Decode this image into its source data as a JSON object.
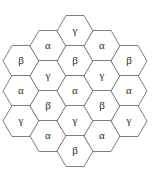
{
  "figure": {
    "name": "hexagonal-tiling-diagram",
    "type": "hexagon-grid",
    "width": 164,
    "height": 181,
    "background_color": "#ffffff",
    "stroke_color": "#5d5d5d",
    "label_color": "#2b2b2b",
    "hex_count": 19,
    "orientation": "flat-top",
    "hex_radius": 18,
    "hex_width": 36,
    "hex_height": 31,
    "columns": [
      {
        "cx": 21,
        "labels": [
          "β",
          "α",
          "γ"
        ],
        "cys": [
          61,
          91,
          121
        ]
      },
      {
        "cx": 48,
        "labels": [
          "α",
          "γ",
          "β",
          "α"
        ],
        "cys": [
          46,
          76,
          106,
          136
        ]
      },
      {
        "cx": 75,
        "labels": [
          "γ",
          "β",
          "α",
          "γ",
          "β"
        ],
        "cys": [
          31,
          61,
          91,
          121,
          151
        ]
      },
      {
        "cx": 102,
        "labels": [
          "α",
          "γ",
          "β",
          "α"
        ],
        "cys": [
          46,
          76,
          106,
          136
        ]
      },
      {
        "cx": 129,
        "labels": [
          "β",
          "α",
          "γ"
        ],
        "cys": [
          61,
          91,
          121
        ]
      }
    ],
    "cells": [
      {
        "id": "c0-r0",
        "label": "β",
        "cx": 21,
        "cy": 61
      },
      {
        "id": "c0-r1",
        "label": "α",
        "cx": 21,
        "cy": 91
      },
      {
        "id": "c0-r2",
        "label": "γ",
        "cx": 21,
        "cy": 121
      },
      {
        "id": "c1-r0",
        "label": "α",
        "cx": 48,
        "cy": 46
      },
      {
        "id": "c1-r1",
        "label": "γ",
        "cx": 48,
        "cy": 76
      },
      {
        "id": "c1-r2",
        "label": "β",
        "cx": 48,
        "cy": 106
      },
      {
        "id": "c1-r3",
        "label": "α",
        "cx": 48,
        "cy": 136
      },
      {
        "id": "c2-r0",
        "label": "γ",
        "cx": 75,
        "cy": 31
      },
      {
        "id": "c2-r1",
        "label": "β",
        "cx": 75,
        "cy": 61
      },
      {
        "id": "c2-r2",
        "label": "α",
        "cx": 75,
        "cy": 91
      },
      {
        "id": "c2-r3",
        "label": "γ",
        "cx": 75,
        "cy": 121
      },
      {
        "id": "c2-r4",
        "label": "β",
        "cx": 75,
        "cy": 151
      },
      {
        "id": "c3-r0",
        "label": "α",
        "cx": 102,
        "cy": 46
      },
      {
        "id": "c3-r1",
        "label": "γ",
        "cx": 102,
        "cy": 76
      },
      {
        "id": "c3-r2",
        "label": "β",
        "cx": 102,
        "cy": 106
      },
      {
        "id": "c3-r3",
        "label": "α",
        "cx": 102,
        "cy": 136
      },
      {
        "id": "c4-r0",
        "label": "β",
        "cx": 129,
        "cy": 61
      },
      {
        "id": "c4-r1",
        "label": "α",
        "cx": 129,
        "cy": 91
      },
      {
        "id": "c4-r2",
        "label": "γ",
        "cx": 129,
        "cy": 121
      }
    ],
    "legend": {
      "symbols": [
        "α",
        "β",
        "γ"
      ]
    }
  }
}
